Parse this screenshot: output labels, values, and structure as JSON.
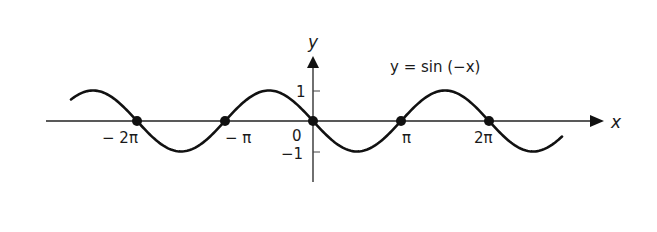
{
  "chart_data": {
    "type": "line",
    "title": "y = sin (−x)",
    "xlabel": "x",
    "ylabel": "y",
    "function": "y = sin(-x)",
    "x_range": [
      -2.75,
      2.83
    ],
    "x_range_units": "pi",
    "ylim": [
      -1,
      1
    ],
    "x_tick_labels": [
      "− 2π",
      "− π",
      "0",
      "π",
      "2π"
    ],
    "x_ticks": [
      -6.2832,
      -3.1416,
      0,
      3.1416,
      6.2832
    ],
    "y_tick_labels": [
      "1",
      "−1"
    ],
    "y_ticks": [
      1,
      -1
    ],
    "marked_points": [
      {
        "x": -6.2832,
        "y": 0,
        "label": "−2π"
      },
      {
        "x": -3.1416,
        "y": 0,
        "label": "−π"
      },
      {
        "x": 0,
        "y": 0,
        "label": "0"
      },
      {
        "x": 3.1416,
        "y": 0,
        "label": "π"
      },
      {
        "x": 6.2832,
        "y": 0,
        "label": "2π"
      }
    ],
    "grid": false,
    "legend": null
  },
  "labels": {
    "equation": "y = sin (−x)",
    "x_axis": "x",
    "y_axis": "y",
    "origin": "0",
    "y_one": "1",
    "y_neg_one": "−1",
    "neg_two_pi": "− 2π",
    "neg_pi": "− π",
    "pi": "π",
    "two_pi": "2π"
  }
}
